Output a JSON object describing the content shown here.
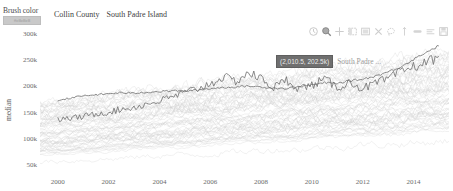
{
  "controls": {
    "brush_color": {
      "label": "Brush color",
      "swatch_text": "#c8c8c8",
      "swatch_hex": "#c9c9c9"
    }
  },
  "legend": {
    "items": [
      {
        "label": "Collin County"
      },
      {
        "label": "South Padre Island"
      }
    ]
  },
  "toolbar": {
    "tools": [
      {
        "name": "reset-icon",
        "title": "Reset"
      },
      {
        "name": "box-zoom-icon",
        "title": "Box Zoom"
      },
      {
        "name": "crosshair-icon",
        "title": "Crosshair"
      },
      {
        "name": "box-select-icon",
        "title": "Box Select"
      },
      {
        "name": "tap-select-icon",
        "title": "Tap Select"
      },
      {
        "name": "close-icon",
        "title": "Clear Selection"
      },
      {
        "name": "lasso-select-icon",
        "title": "Lasso Select"
      },
      {
        "name": "pan-icon",
        "title": "Pan"
      },
      {
        "name": "wheel-zoom-icon",
        "title": "Wheel Zoom"
      },
      {
        "name": "hover-icon",
        "title": "Hover"
      },
      {
        "name": "save-icon",
        "title": "Save"
      }
    ]
  },
  "hover": {
    "coordinate_label": "(2,010.5, 202.5k)",
    "series_label": "South Padre ...",
    "x_value": 2010.5,
    "y_value": 202500
  },
  "chart_data": {
    "type": "line",
    "title": "",
    "xlabel": "",
    "ylabel": "median",
    "xlim": [
      1999.3,
      2015.4
    ],
    "xticks": [
      2000,
      2002,
      2004,
      2006,
      2008,
      2010,
      2012,
      2014
    ],
    "xtick_labels": [
      "2000",
      "2002",
      "2004",
      "2006",
      "2008",
      "2010",
      "2012",
      "2014"
    ],
    "ylim": [
      30000,
      320000
    ],
    "yticks": [
      50000,
      100000,
      150000,
      200000,
      250000,
      300000
    ],
    "ytick_labels": [
      "50k",
      "100k",
      "150k",
      "200k",
      "250k",
      "300k"
    ],
    "grid": false,
    "legend_position": "top-left",
    "colors": {
      "background_series": "#cfcfcf",
      "highlight_series": "#6f6f6f",
      "axis_text": "#6b6b6b"
    },
    "series": [
      {
        "name": "Collin County",
        "style": "highlight",
        "x": [
          2000,
          2000.5,
          2001,
          2001.5,
          2002,
          2002.5,
          2003,
          2003.5,
          2004,
          2004.5,
          2005,
          2005.5,
          2006,
          2006.5,
          2007,
          2007.5,
          2008,
          2008.5,
          2009,
          2009.5,
          2010,
          2010.5,
          2011,
          2011.5,
          2012,
          2012.5,
          2013,
          2013.5,
          2014,
          2014.5,
          2015
        ],
        "values": [
          173000,
          178000,
          182000,
          184000,
          186000,
          188000,
          187000,
          189000,
          190000,
          192000,
          191000,
          193000,
          196000,
          198000,
          199000,
          201000,
          199000,
          197000,
          196000,
          200000,
          203000,
          207000,
          206000,
          211000,
          214000,
          220000,
          228000,
          238000,
          252000,
          266000,
          278000
        ]
      },
      {
        "name": "South Padre Island",
        "style": "highlight",
        "x": [
          2000,
          2000.5,
          2001,
          2001.5,
          2002,
          2002.5,
          2003,
          2003.5,
          2004,
          2004.5,
          2005,
          2005.5,
          2006,
          2006.5,
          2007,
          2007.5,
          2008,
          2008.5,
          2009,
          2009.5,
          2010,
          2010.5,
          2011,
          2011.5,
          2012,
          2012.5,
          2013,
          2013.5,
          2014,
          2014.5,
          2015
        ],
        "values": [
          136000,
          139000,
          142000,
          148000,
          151000,
          156000,
          160000,
          166000,
          172000,
          180000,
          188000,
          196000,
          205000,
          218000,
          210000,
          226000,
          215000,
          198000,
          212000,
          196000,
          202500,
          214000,
          198000,
          208000,
          196000,
          206000,
          214000,
          228000,
          238000,
          246000,
          258000
        ]
      }
    ],
    "background_series_count": 60,
    "background_band": {
      "low_start": 52000,
      "low_end": 92000,
      "high_start": 168000,
      "high_end": 262000
    }
  }
}
